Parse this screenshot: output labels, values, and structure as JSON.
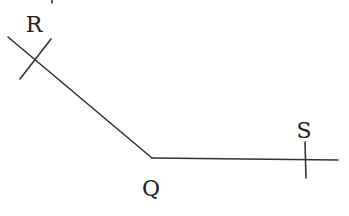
{
  "diagram": {
    "type": "angle construction",
    "points": {
      "R": {
        "label": "R",
        "x": 34,
        "y": 32
      },
      "Q": {
        "label": "Q",
        "x": 151,
        "y": 196
      },
      "S": {
        "label": "S",
        "x": 304,
        "y": 138
      }
    },
    "vertex": {
      "name": "Q",
      "x": 152,
      "y": 158
    },
    "rays": [
      {
        "name": "QR",
        "from": [
          152,
          158
        ],
        "to": [
          8,
          37
        ]
      },
      {
        "name": "QS",
        "from": [
          152,
          158
        ],
        "to": [
          338,
          160
        ]
      }
    ],
    "marks": [
      {
        "name": "arc-mark-on-QR",
        "from": [
          51,
          39
        ],
        "to": [
          20,
          79
        ]
      },
      {
        "name": "arc-mark-on-QS",
        "from": [
          305,
          142
        ],
        "to": [
          306,
          178
        ]
      }
    ],
    "colors": {
      "line": "#333333",
      "text": "#222222",
      "background": "#ffffff"
    }
  }
}
